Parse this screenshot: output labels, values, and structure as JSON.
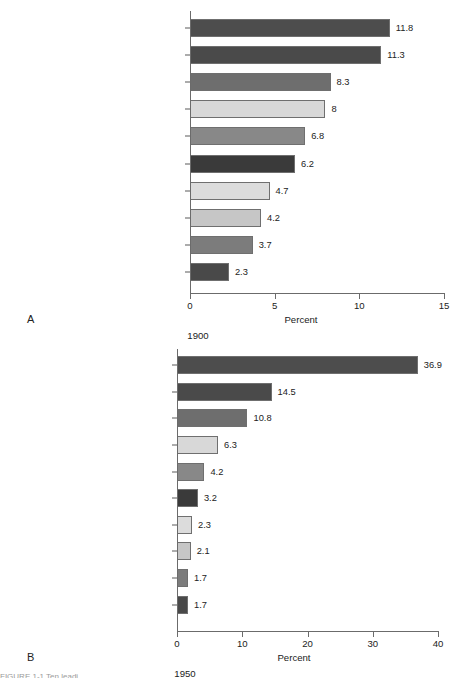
{
  "figure": {
    "panels": [
      "A",
      "B"
    ],
    "caption_sliver": "FIGURE 1-1  Ten leadi"
  },
  "chart_data": [
    {
      "type": "bar",
      "orientation": "horizontal",
      "panel_letter": "A",
      "title": "1900",
      "xlabel": "Percent",
      "ylabel": "",
      "xlim": [
        0,
        15
      ],
      "xticks": [
        0,
        5,
        10,
        15
      ],
      "xticklabels": [
        "0",
        "5",
        "10",
        "15"
      ],
      "grid": false,
      "legend": "none",
      "categories": [
        "Pneumonia and influenza",
        "Tuberculosis",
        "Gastritis, enteritis, colitis",
        "Heart diseases",
        "Symptoms, senility, ill-defined",
        "Vascular lesions affecting CNS",
        "Chronic nephritis and renal sclerosis",
        "Unintentional injuries",
        "Malignant neoplasms",
        "Diphtheria"
      ],
      "values": [
        11.8,
        11.3,
        8.3,
        8,
        6.8,
        6.2,
        4.7,
        4.2,
        3.7,
        2.3
      ],
      "value_labels": [
        "11.8",
        "11.3",
        "8.3",
        "8",
        "6.8",
        "6.2",
        "4.7",
        "4.2",
        "3.7",
        "2.3"
      ],
      "bar_colors": [
        "#4d4d4d",
        "#4a4a4a",
        "#6e6e6e",
        "#d8d8d8",
        "#888888",
        "#3a3a3a",
        "#dcdcdc",
        "#c6c6c6",
        "#7c7c7c",
        "#494949"
      ]
    },
    {
      "type": "bar",
      "orientation": "horizontal",
      "panel_letter": "B",
      "title": "1950",
      "xlabel": "Percent",
      "ylabel": "",
      "xlim": [
        0,
        40
      ],
      "xticks": [
        0,
        10,
        20,
        30,
        40
      ],
      "xticklabels": [
        "0",
        "10",
        "20",
        "30",
        "40"
      ],
      "grid": false,
      "legend": "none",
      "categories": [
        "Disease of the heart",
        "Malignant neoplasms",
        "CNS vascular lesions",
        "Accidents",
        "Certain diseases of early infancy",
        "Influenza and pneumonia",
        "Tuberculosis",
        "General ateriosclerosis",
        "Nephritis and renal sclerosis",
        "Diabetes mellitus"
      ],
      "values": [
        36.9,
        14.5,
        10.8,
        6.3,
        4.2,
        3.2,
        2.3,
        2.1,
        1.7,
        1.7
      ],
      "value_labels": [
        "36.9",
        "14.5",
        "10.8",
        "6.3",
        "4.2",
        "3.2",
        "2.3",
        "2.1",
        "1.7",
        "1.7"
      ],
      "bar_colors": [
        "#4d4d4d",
        "#4a4a4a",
        "#6e6e6e",
        "#d8d8d8",
        "#888888",
        "#3a3a3a",
        "#dcdcdc",
        "#c6c6c6",
        "#7c7c7c",
        "#494949"
      ]
    }
  ]
}
